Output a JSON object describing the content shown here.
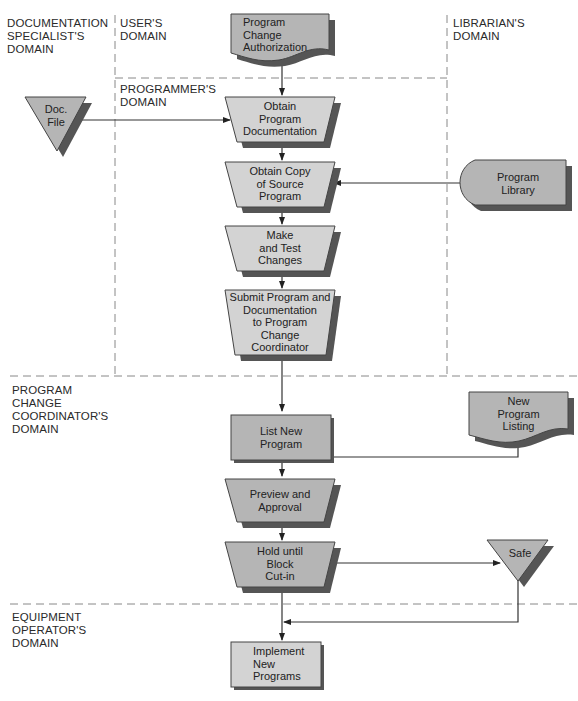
{
  "diagram": {
    "type": "systems-flowchart",
    "colors": {
      "process_fill_light": "#d3d3d3",
      "process_fill_dark": "#b5b5b5",
      "shadow": "#555555",
      "line": "#333333",
      "lane_divider": "#888888"
    },
    "lanes": {
      "documentation_specialist": "DOCUMENTATION\nSPECIALIST'S\nDOMAIN",
      "user": "USER'S\nDOMAIN",
      "librarian": "LIBRARIAN'S\nDOMAIN",
      "programmer": "PROGRAMMER'S\nDOMAIN",
      "program_change_coordinator": "PROGRAM\nCHANGE\nCOORDINATOR'S\nDOMAIN",
      "equipment_operator": "EQUIPMENT\nOPERATOR'S\nDOMAIN"
    },
    "nodes": {
      "program_change_authorization": {
        "label": "Program\nChange\nAuthorization",
        "shape": "document"
      },
      "doc_file": {
        "label": "Doc.\nFile",
        "shape": "offline-storage"
      },
      "obtain_program_documentation": {
        "label": "Obtain\nProgram\nDocumentation",
        "shape": "manual-operation"
      },
      "obtain_copy_source": {
        "label": "Obtain Copy\nof Source\nProgram",
        "shape": "manual-operation"
      },
      "program_library": {
        "label": "Program\nLibrary",
        "shape": "online-storage"
      },
      "make_test_changes": {
        "label": "Make\nand Test\nChanges",
        "shape": "manual-operation"
      },
      "submit_program": {
        "label": "Submit Program and\nDocumentation\nto Program\nChange\nCoordinator",
        "shape": "manual-operation"
      },
      "list_new_program": {
        "label": "List New\nProgram",
        "shape": "process"
      },
      "new_program_listing": {
        "label": "New\nProgram\nListing",
        "shape": "document"
      },
      "preview_approval": {
        "label": "Preview and\nApproval",
        "shape": "manual-operation"
      },
      "hold_until_block": {
        "label": "Hold until\nBlock\nCut-in",
        "shape": "manual-operation"
      },
      "safe": {
        "label": "Safe",
        "shape": "offline-storage"
      },
      "implement_new_programs": {
        "label": "Implement\nNew\nPrograms",
        "shape": "process"
      }
    },
    "edges": [
      [
        "program_change_authorization",
        "obtain_program_documentation"
      ],
      [
        "doc_file",
        "obtain_program_documentation"
      ],
      [
        "obtain_program_documentation",
        "obtain_copy_source"
      ],
      [
        "program_library",
        "obtain_copy_source"
      ],
      [
        "obtain_copy_source",
        "make_test_changes"
      ],
      [
        "make_test_changes",
        "submit_program"
      ],
      [
        "submit_program",
        "list_new_program"
      ],
      [
        "list_new_program",
        "preview_approval"
      ],
      [
        "new_program_listing",
        "preview_approval"
      ],
      [
        "preview_approval",
        "hold_until_block"
      ],
      [
        "hold_until_block",
        "safe"
      ],
      [
        "hold_until_block",
        "implement_new_programs"
      ],
      [
        "safe",
        "implement_new_programs"
      ]
    ]
  }
}
